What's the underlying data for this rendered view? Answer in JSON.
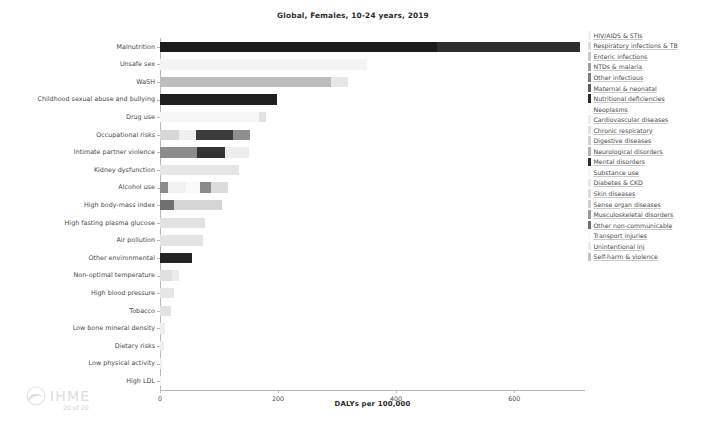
{
  "chart_data": {
    "type": "bar",
    "orientation": "horizontal",
    "stacked": true,
    "title": "Global, Females, 10-24 years, 2019",
    "xlabel": "DALYs per 100,000",
    "ylabel": "",
    "xlim": [
      0,
      720
    ],
    "xticks": [
      0,
      200,
      400,
      600
    ],
    "xticklabels": [
      "0",
      "200",
      "400",
      "600"
    ],
    "grid": false,
    "legend_position": "right",
    "categories": [
      "Malnutrition",
      "Unsafe sex",
      "WaSH",
      "Childhood sexual abuse and bullying",
      "Drug use",
      "Occupational risks",
      "Intimate partner violence",
      "Kidney dysfunction",
      "Alcohol use",
      "High body-mass index",
      "High fasting plasma glucose",
      "Air pollution",
      "Other environmental",
      "Non-optimal temperature",
      "High blood pressure",
      "Tobacco",
      "Low bone mineral density",
      "Dietary risks",
      "Low physical activity",
      "High LDL"
    ],
    "totals": [
      712,
      351,
      318,
      199,
      180,
      153,
      150,
      134,
      116,
      105,
      76,
      72,
      54,
      33,
      23,
      19,
      9,
      6,
      4,
      2
    ],
    "series": [
      {
        "name": "HIV/AIDS & STIs",
        "color": "#f2f2f2"
      },
      {
        "name": "Respiratory infections & TB",
        "color": "#dcdcdc"
      },
      {
        "name": "Enteric infections",
        "color": "#c9c9c9"
      },
      {
        "name": "NTDs & malaria",
        "color": "#9e9e9e"
      },
      {
        "name": "Other infectious",
        "color": "#7d7d7d"
      },
      {
        "name": "Maternal & neonatal",
        "color": "#5a5a5a"
      },
      {
        "name": "Nutritional deficiencies",
        "color": "#2a2a2a"
      },
      {
        "name": "Neoplasms",
        "color": "#fbfbfb"
      },
      {
        "name": "Cardiovascular diseases",
        "color": "#ededed"
      },
      {
        "name": "Chronic respiratory",
        "color": "#e0e0e0"
      },
      {
        "name": "Digestive diseases",
        "color": "#d2d2d2"
      },
      {
        "name": "Neurological disorders",
        "color": "#b5b5b5"
      },
      {
        "name": "Mental disorders",
        "color": "#2f2f2f"
      },
      {
        "name": "Substance use",
        "color": "#f7f7f7"
      },
      {
        "name": "Diabetes & CKD",
        "color": "#e9e9e9"
      },
      {
        "name": "Skin diseases",
        "color": "#dddddd"
      },
      {
        "name": "Sense organ diseases",
        "color": "#cfcfcf"
      },
      {
        "name": "Musculoskeletal disorders",
        "color": "#9a9a9a"
      },
      {
        "name": "Other non-communicable",
        "color": "#707070"
      },
      {
        "name": "Transport injuries",
        "color": "#fafafa"
      },
      {
        "name": "Unintentional inj",
        "color": "#ececec"
      },
      {
        "name": "Self-harm & violence",
        "color": "#c2c2c2"
      }
    ],
    "bars": [
      {
        "category": "Malnutrition",
        "segments": [
          {
            "series": "Nutritional deficiencies",
            "value": 470,
            "color": "#1c1c1c"
          },
          {
            "series": "Maternal & neonatal",
            "value": 242,
            "color": "#2e2e2e"
          }
        ]
      },
      {
        "category": "Unsafe sex",
        "segments": [
          {
            "series": "HIV/AIDS & STIs",
            "value": 351,
            "color": "#f4f4f4"
          }
        ]
      },
      {
        "category": "WaSH",
        "segments": [
          {
            "series": "Enteric infections",
            "value": 290,
            "color": "#bdbdbd"
          },
          {
            "series": "NTDs & malaria",
            "value": 28,
            "color": "#e8e8e8"
          }
        ]
      },
      {
        "category": "Childhood sexual abuse and bullying",
        "segments": [
          {
            "series": "Mental disorders",
            "value": 199,
            "color": "#1f1f1f"
          }
        ]
      },
      {
        "category": "Drug use",
        "segments": [
          {
            "series": "Substance use",
            "value": 168,
            "color": "#f6f6f6"
          },
          {
            "series": "Self-harm & violence",
            "value": 12,
            "color": "#e2e2e2"
          }
        ]
      },
      {
        "category": "Occupational risks",
        "segments": [
          {
            "series": "Chronic respiratory",
            "value": 33,
            "color": "#d8d8d8"
          },
          {
            "series": "Musculoskeletal disorders",
            "value": 28,
            "color": "#f0f0f0"
          },
          {
            "series": "Other non-communicable",
            "value": 62,
            "color": "#3c3c3c"
          },
          {
            "series": "Unintentional inj",
            "value": 30,
            "color": "#8f8f8f"
          }
        ]
      },
      {
        "category": "Intimate partner violence",
        "segments": [
          {
            "series": "Mental disorders",
            "value": 62,
            "color": "#8c8c8c"
          },
          {
            "series": "Self-harm & violence",
            "value": 48,
            "color": "#333333"
          },
          {
            "series": "Other non-communicable",
            "value": 40,
            "color": "#ededed"
          }
        ]
      },
      {
        "category": "Kidney dysfunction",
        "segments": [
          {
            "series": "Diabetes & CKD",
            "value": 134,
            "color": "#e6e6e6"
          }
        ]
      },
      {
        "category": "Alcohol use",
        "segments": [
          {
            "series": "Substance use",
            "value": 14,
            "color": "#8b8b8b"
          },
          {
            "series": "Digestive diseases",
            "value": 30,
            "color": "#f2f2f2"
          },
          {
            "series": "Transport injuries",
            "value": 24,
            "color": "#fafafa"
          },
          {
            "series": "Self-harm & violence",
            "value": 18,
            "color": "#8a8a8a"
          },
          {
            "series": "Other non-communicable",
            "value": 30,
            "color": "#dcdcdc"
          }
        ]
      },
      {
        "category": "High body-mass index",
        "segments": [
          {
            "series": "Cardiovascular diseases",
            "value": 24,
            "color": "#6f6f6f"
          },
          {
            "series": "Diabetes & CKD",
            "value": 81,
            "color": "#d5d5d5"
          }
        ]
      },
      {
        "category": "High fasting plasma glucose",
        "segments": [
          {
            "series": "Diabetes & CKD",
            "value": 76,
            "color": "#e2e2e2"
          }
        ]
      },
      {
        "category": "Air pollution",
        "segments": [
          {
            "series": "Chronic respiratory",
            "value": 72,
            "color": "#e4e4e4"
          }
        ]
      },
      {
        "category": "Other environmental",
        "segments": [
          {
            "series": "Unintentional inj",
            "value": 54,
            "color": "#242424"
          }
        ]
      },
      {
        "category": "Non-optimal temperature",
        "segments": [
          {
            "series": "Cardiovascular diseases",
            "value": 20,
            "color": "#e0e0e0"
          },
          {
            "series": "Other non-communicable",
            "value": 13,
            "color": "#ececec"
          }
        ]
      },
      {
        "category": "High blood pressure",
        "segments": [
          {
            "series": "Cardiovascular diseases",
            "value": 23,
            "color": "#e6e6e6"
          }
        ]
      },
      {
        "category": "Tobacco",
        "segments": [
          {
            "series": "Chronic respiratory",
            "value": 19,
            "color": "#e3e3e3"
          }
        ]
      },
      {
        "category": "Low bone mineral density",
        "segments": [
          {
            "series": "Unintentional inj",
            "value": 9,
            "color": "#ededed"
          }
        ]
      },
      {
        "category": "Dietary risks",
        "segments": [
          {
            "series": "Cardiovascular diseases",
            "value": 6,
            "color": "#efefef"
          }
        ]
      },
      {
        "category": "Low physical activity",
        "segments": [
          {
            "series": "Cardiovascular diseases",
            "value": 4,
            "color": "#f1f1f1"
          }
        ]
      },
      {
        "category": "High LDL",
        "segments": [
          {
            "series": "Cardiovascular diseases",
            "value": 2,
            "color": "#f2f2f2"
          }
        ]
      }
    ]
  },
  "watermark": {
    "brand": "IHME",
    "page_count": "20 of 20"
  }
}
